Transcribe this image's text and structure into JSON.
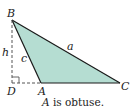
{
  "diagram": {
    "colors": {
      "fill": "#b5ddd2",
      "stroke": "#1a1a1a",
      "dashed": "#555555"
    },
    "vertices": {
      "B": {
        "label": "B",
        "x": 12,
        "y": 20
      },
      "D": {
        "label": "D",
        "x": 12,
        "y": 83
      },
      "A": {
        "label": "A",
        "x": 41,
        "y": 83
      },
      "C": {
        "label": "C",
        "x": 120,
        "y": 83
      }
    },
    "sides": {
      "a": "a",
      "c": "c",
      "h": "h"
    },
    "caption": {
      "vertex": "A",
      "text": " is obtuse."
    }
  }
}
